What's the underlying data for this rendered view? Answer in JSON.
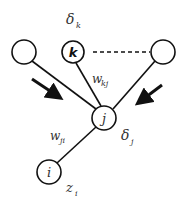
{
  "diagram": {
    "type": "neural-network-backprop",
    "colors": {
      "stroke": "#111111",
      "text": "#333333",
      "background": "#ffffff"
    },
    "nodes": [
      {
        "id": "left",
        "label": "",
        "cx": 24,
        "cy": 52,
        "r": 12
      },
      {
        "id": "k",
        "label": "k",
        "cx": 73,
        "cy": 52,
        "r": 11
      },
      {
        "id": "right",
        "label": "",
        "cx": 163,
        "cy": 52,
        "r": 12
      },
      {
        "id": "j",
        "label": "j",
        "cx": 104,
        "cy": 118,
        "r": 12
      },
      {
        "id": "i",
        "label": "i",
        "cx": 49,
        "cy": 172,
        "r": 12
      }
    ],
    "labels": {
      "delta_k": {
        "base": "δ",
        "sub": "k"
      },
      "w_kj": {
        "base": "w",
        "sub": "kj"
      },
      "w_ji": {
        "base": "w",
        "sub": "ji"
      },
      "delta_j": {
        "base": "δ",
        "sub": "j"
      },
      "z_i": {
        "base": "z",
        "sub": "i"
      }
    },
    "arrows": [
      {
        "id": "left-arrow",
        "direction": "down-right"
      },
      {
        "id": "right-arrow",
        "direction": "down-left"
      }
    ],
    "dashed_connection": {
      "from": "k",
      "to": "right"
    }
  }
}
